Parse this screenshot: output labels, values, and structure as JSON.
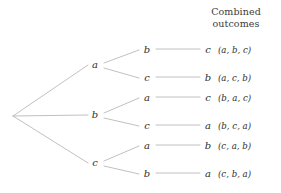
{
  "header": {
    "line1": "Combined",
    "line2": "outcomes"
  },
  "colors": {
    "line": "#b9b9b9",
    "text": "#2e2e2e",
    "header_text": "#3a3a3a",
    "background": "#ffffff"
  },
  "tree": {
    "root": {
      "x": 13,
      "y": 116
    },
    "level1": [
      {
        "label": "a",
        "x": 95,
        "y": 65
      },
      {
        "label": "b",
        "x": 95,
        "y": 115
      },
      {
        "label": "c",
        "x": 95,
        "y": 163
      }
    ],
    "level2": [
      {
        "label": "b",
        "x": 146,
        "y": 50
      },
      {
        "label": "c",
        "x": 146,
        "y": 78
      },
      {
        "label": "a",
        "x": 146,
        "y": 98
      },
      {
        "label": "c",
        "x": 146,
        "y": 126
      },
      {
        "label": "a",
        "x": 146,
        "y": 146
      },
      {
        "label": "b",
        "x": 146,
        "y": 174
      }
    ],
    "level3": [
      {
        "label": "c",
        "x": 207,
        "y": 50
      },
      {
        "label": "b",
        "x": 207,
        "y": 78
      },
      {
        "label": "c",
        "x": 207,
        "y": 98
      },
      {
        "label": "a",
        "x": 207,
        "y": 126
      },
      {
        "label": "b",
        "x": 207,
        "y": 146
      },
      {
        "label": "a",
        "x": 207,
        "y": 174
      }
    ]
  },
  "outcomes": [
    {
      "text": "(a, b, c)",
      "y": 50
    },
    {
      "text": "(a, c, b)",
      "y": 78
    },
    {
      "text": "(b, a, c)",
      "y": 98
    },
    {
      "text": "(b, c, a)",
      "y": 126
    },
    {
      "text": "(c, a, b)",
      "y": 146
    },
    {
      "text": "(c, b, a)",
      "y": 174
    }
  ]
}
